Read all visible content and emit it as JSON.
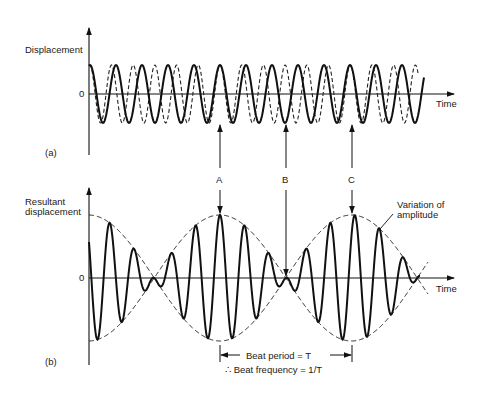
{
  "panel_a": {
    "tag": "(a)",
    "y_label": "Displacement",
    "zero_label": "0",
    "x_label": "Time",
    "wave1": {
      "style": "solid",
      "cycles_visible": 11
    },
    "wave2": {
      "style": "dashed",
      "cycles_visible": 12
    }
  },
  "panel_b": {
    "tag": "(b)",
    "y_label_line1": "Resultant",
    "y_label_line2": "displacement",
    "zero_label": "0",
    "x_label": "Time",
    "envelope_label_line1": "Variation of",
    "envelope_label_line2": "amplitude",
    "beat_period_label": "Beat period = T",
    "beat_frequency_label": "∴ Beat frequency = 1/T"
  },
  "markers": [
    {
      "label": "A",
      "meaning": "waves in phase - maximum resultant"
    },
    {
      "label": "B",
      "meaning": "waves in antiphase - minimum resultant"
    },
    {
      "label": "C",
      "meaning": "waves in phase - maximum resultant"
    }
  ],
  "chart_data": [
    {
      "type": "line",
      "title": "(a) Two waves of slightly different frequency",
      "xlabel": "Time",
      "ylabel": "Displacement",
      "series": [
        {
          "name": "wave 1 (solid)",
          "amplitude": 1,
          "relative_frequency": 1.0
        },
        {
          "name": "wave 2 (dashed)",
          "amplitude": 1,
          "relative_frequency": 1.1
        }
      ]
    },
    {
      "type": "line",
      "title": "(b) Superposition showing beats",
      "xlabel": "Time",
      "ylabel": "Resultant displacement",
      "series": [
        {
          "name": "resultant (solid)",
          "note": "sum of wave 1 and wave 2"
        },
        {
          "name": "variation of amplitude (dashed envelope)",
          "note": "maxima at A and C, minimum at B"
        }
      ],
      "annotations": [
        "Beat period = T",
        "∴ Beat frequency = 1/T"
      ]
    }
  ]
}
